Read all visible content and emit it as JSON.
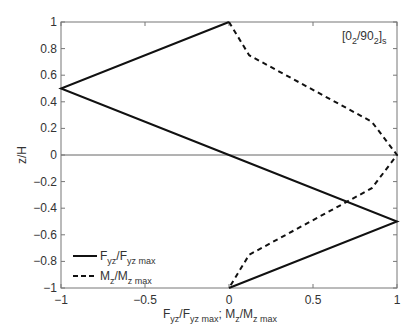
{
  "chart_data": {
    "type": "line",
    "title": "",
    "annotation": {
      "text": "[0",
      "sub1": "2",
      "mid": "/90",
      "sub2": "2",
      "end": "]",
      "sub3": "s"
    },
    "xlabel": {
      "parts": [
        "F",
        "yz",
        "/F",
        "yz max",
        "; M",
        "z",
        "/M",
        "z max"
      ]
    },
    "ylabel": "z/H",
    "xlim": [
      -1,
      1
    ],
    "ylim": [
      -1,
      1
    ],
    "xticks": [
      -1,
      -0.5,
      0,
      0.5,
      1
    ],
    "xtick_labels": [
      "−1",
      "−0.5",
      "0",
      "0.5",
      "1"
    ],
    "yticks": [
      1,
      0.8,
      0.6,
      0.4,
      0.2,
      0,
      -0.2,
      -0.4,
      -0.6,
      -0.8,
      -1
    ],
    "ytick_labels": [
      "1",
      "0.8",
      "0.6",
      "0.4",
      "0.2",
      "0",
      "−0.2",
      "−0.4",
      "−0.6",
      "−0.8",
      "−1"
    ],
    "grid": false,
    "zero_line": true,
    "legend_position": "lower left",
    "series": [
      {
        "name": "Fyz/Fyz max",
        "style": "solid",
        "legend": {
          "a": "F",
          "b": "yz",
          "c": "/F",
          "d": "yz max"
        },
        "x": [
          0,
          -1,
          0,
          1,
          0
        ],
        "y": [
          1,
          0.5,
          0,
          -0.5,
          -1
        ]
      },
      {
        "name": "Mz/Mz max",
        "style": "dashed",
        "legend": {
          "a": "M",
          "b": "z",
          "c": "/M",
          "d": "z max"
        },
        "x": [
          0,
          0.12,
          0.85,
          1,
          0.85,
          0.12,
          0
        ],
        "y": [
          1,
          0.75,
          0.25,
          0,
          -0.25,
          -0.75,
          -1
        ]
      }
    ]
  }
}
